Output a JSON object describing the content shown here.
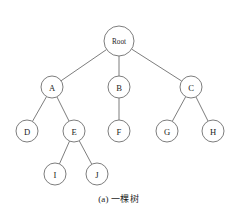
{
  "figure": {
    "caption": "(a) 一棵树",
    "caption_label": "(a)",
    "caption_text": "一棵树",
    "width": 237,
    "height": 214,
    "background_color": "#ffffff",
    "stroke_color": "#6e6e6e",
    "text_color": "#1c1c1c"
  },
  "chart_data": {
    "type": "diagram",
    "diagram_type": "tree",
    "title": "(a) 一棵树",
    "nodes": [
      {
        "id": "root",
        "label": "Root",
        "x": 119,
        "y": 41,
        "r": 15,
        "level": 0
      },
      {
        "id": "a",
        "label": "A",
        "x": 52,
        "y": 87,
        "r": 11,
        "level": 1
      },
      {
        "id": "b",
        "label": "B",
        "x": 119,
        "y": 87,
        "r": 11,
        "level": 1
      },
      {
        "id": "c",
        "label": "C",
        "x": 191,
        "y": 87,
        "r": 11,
        "level": 1
      },
      {
        "id": "d",
        "label": "D",
        "x": 27,
        "y": 131,
        "r": 11,
        "level": 2
      },
      {
        "id": "e",
        "label": "E",
        "x": 74,
        "y": 131,
        "r": 11,
        "level": 2
      },
      {
        "id": "f",
        "label": "F",
        "x": 119,
        "y": 131,
        "r": 11,
        "level": 2
      },
      {
        "id": "g",
        "label": "G",
        "x": 167,
        "y": 131,
        "r": 11,
        "level": 2
      },
      {
        "id": "h",
        "label": "H",
        "x": 213,
        "y": 131,
        "r": 11,
        "level": 2
      },
      {
        "id": "i",
        "label": "I",
        "x": 55,
        "y": 174,
        "r": 11,
        "level": 3
      },
      {
        "id": "j",
        "label": "J",
        "x": 97,
        "y": 174,
        "r": 11,
        "level": 3
      }
    ],
    "edges": [
      {
        "from": "root",
        "to": "a"
      },
      {
        "from": "root",
        "to": "b"
      },
      {
        "from": "root",
        "to": "c"
      },
      {
        "from": "a",
        "to": "d"
      },
      {
        "from": "a",
        "to": "e"
      },
      {
        "from": "b",
        "to": "f"
      },
      {
        "from": "c",
        "to": "g"
      },
      {
        "from": "c",
        "to": "h"
      },
      {
        "from": "e",
        "to": "i"
      },
      {
        "from": "e",
        "to": "j"
      }
    ]
  }
}
